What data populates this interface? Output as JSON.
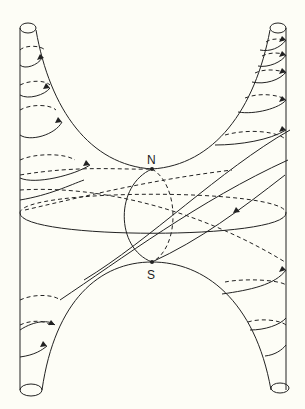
{
  "diagram": {
    "type": "hyperboloid-like surface with helical field lines",
    "labels": {
      "north": "N",
      "south": "S"
    },
    "points": [
      {
        "label": "N",
        "x": 152,
        "y": 169
      },
      {
        "label": "S",
        "x": 152,
        "y": 262
      }
    ],
    "stroke_color": "#222222",
    "background_color": "#fdfdf6"
  }
}
